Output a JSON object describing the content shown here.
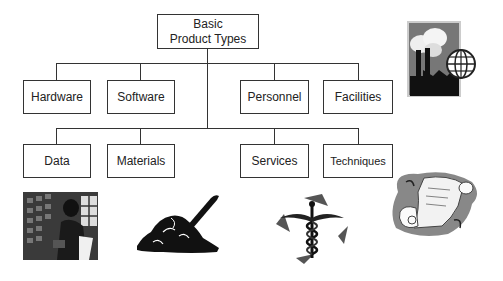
{
  "diagram": {
    "root": {
      "label_line1": "Basic",
      "label_line2": "Product Types"
    },
    "row1": [
      {
        "label": "Hardware"
      },
      {
        "label": "Software"
      },
      {
        "label": "Personnel"
      },
      {
        "label": "Facilities"
      }
    ],
    "row2": [
      {
        "label": "Data"
      },
      {
        "label": "Materials"
      },
      {
        "label": "Services"
      },
      {
        "label": "Techniques"
      }
    ]
  },
  "illustrations": [
    {
      "name": "factory-globe-icon",
      "depicts": "factory with globe"
    },
    {
      "name": "data-terminal-icon",
      "depicts": "person at computer data"
    },
    {
      "name": "shovel-dirt-icon",
      "depicts": "shovel in pile of material"
    },
    {
      "name": "caduceus-icon",
      "depicts": "medical caduceus"
    },
    {
      "name": "scroll-icon",
      "depicts": "parchment scroll"
    }
  ],
  "colors": {
    "line": "#333333",
    "text": "#222222",
    "background": "#ffffff"
  }
}
